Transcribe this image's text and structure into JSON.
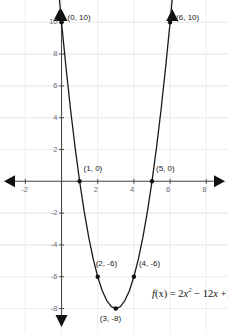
{
  "chart_data": {
    "type": "line",
    "title": "",
    "subtitle": "",
    "xlabel": "",
    "ylabel": "",
    "grid": true,
    "legend": null,
    "equation_text": "f(x) = 2x² − 12x +10",
    "equation_parts": {
      "fn": "f",
      "arg": "(x)",
      "eq": " = 2",
      "var1": "x",
      "exp1": "2",
      "mid": " − 12",
      "var2": "x",
      "tail": " +10"
    },
    "xlim": [
      -3.4,
      9.2
    ],
    "ylim": [
      -9.6,
      11.4
    ],
    "x_ticks": [
      -2,
      2,
      4,
      6,
      8
    ],
    "x_tick_labels": [
      "-2",
      "2",
      "4",
      "6",
      "8"
    ],
    "y_ticks": [
      10,
      8,
      6,
      4,
      2,
      -2,
      -4,
      -6,
      -8
    ],
    "y_tick_labels": [
      "10",
      "8",
      "6",
      "4",
      "2",
      "-2",
      "-4",
      "-6",
      "-8"
    ],
    "curve_points": [
      {
        "x": -0.12,
        "y": 11.49
      },
      {
        "x": 0.0,
        "y": 10.0
      },
      {
        "x": 0.25,
        "y": 7.13
      },
      {
        "x": 0.5,
        "y": 4.5
      },
      {
        "x": 0.75,
        "y": 2.13
      },
      {
        "x": 1.0,
        "y": 0.0
      },
      {
        "x": 1.25,
        "y": -1.88
      },
      {
        "x": 1.5,
        "y": -3.5
      },
      {
        "x": 1.75,
        "y": -4.88
      },
      {
        "x": 2.0,
        "y": -6.0
      },
      {
        "x": 2.25,
        "y": -6.88
      },
      {
        "x": 2.5,
        "y": -7.5
      },
      {
        "x": 2.75,
        "y": -7.88
      },
      {
        "x": 3.0,
        "y": -8.0
      },
      {
        "x": 3.25,
        "y": -7.88
      },
      {
        "x": 3.5,
        "y": -7.5
      },
      {
        "x": 3.75,
        "y": -6.88
      },
      {
        "x": 4.0,
        "y": -6.0
      },
      {
        "x": 4.25,
        "y": -4.88
      },
      {
        "x": 4.5,
        "y": -3.5
      },
      {
        "x": 4.75,
        "y": -1.88
      },
      {
        "x": 5.0,
        "y": 0.0
      },
      {
        "x": 5.25,
        "y": 2.13
      },
      {
        "x": 5.5,
        "y": 4.5
      },
      {
        "x": 5.75,
        "y": 7.13
      },
      {
        "x": 6.0,
        "y": 10.0
      },
      {
        "x": 6.12,
        "y": 11.49
      }
    ],
    "marked_points": [
      {
        "x": 0,
        "y": 10,
        "label": "(0, 10)",
        "label_dx": 6,
        "label_dy": -9
      },
      {
        "x": 6,
        "y": 10,
        "label": "(6, 10)",
        "label_dx": 6,
        "label_dy": -9
      },
      {
        "x": 1,
        "y": 0,
        "label": "(1, 0)",
        "label_dx": 4,
        "label_dy": -17
      },
      {
        "x": 5,
        "y": 0,
        "label": "(5, 0)",
        "label_dx": 4,
        "label_dy": -17
      },
      {
        "x": 2,
        "y": -6,
        "label": "(2, -6)",
        "label_dx": -2,
        "label_dy": -18
      },
      {
        "x": 4,
        "y": -6,
        "label": "(4, -6)",
        "label_dx": 5,
        "label_dy": -18
      },
      {
        "x": 3,
        "y": -8,
        "label": "(3, -8)",
        "label_dx": -16,
        "label_dy": 5
      }
    ],
    "equation_position": {
      "x": 5.0,
      "y": -7.05
    },
    "colors": {
      "curve": "#1a1a1a",
      "axis": "#4a4a4a",
      "grid": "#ececf2",
      "tick_text": "#6e6e6e",
      "point_text": "#1a1a1a",
      "background": "#ffffff"
    }
  }
}
